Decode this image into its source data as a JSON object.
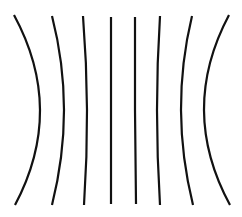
{
  "diagram": {
    "stroke_color": "#111111",
    "background": "#ffffff",
    "lines": [
      {
        "id": "line-1",
        "top": [
          14,
          15
        ],
        "mid": [
          40,
          110
        ],
        "bottom": [
          15,
          205
        ]
      },
      {
        "id": "line-2",
        "top": [
          52,
          16
        ],
        "mid": [
          64,
          110
        ],
        "bottom": [
          52,
          205
        ]
      },
      {
        "id": "line-3",
        "top": [
          83,
          16
        ],
        "mid": [
          87,
          110
        ],
        "bottom": [
          84,
          205
        ]
      },
      {
        "id": "line-4",
        "top": [
          111,
          17
        ],
        "mid": [
          111,
          110
        ],
        "bottom": [
          111,
          204
        ]
      },
      {
        "id": "line-5",
        "top": [
          135,
          17
        ],
        "mid": [
          135,
          110
        ],
        "bottom": [
          136,
          204
        ]
      },
      {
        "id": "line-6",
        "top": [
          160,
          16
        ],
        "mid": [
          157,
          110
        ],
        "bottom": [
          160,
          205
        ]
      },
      {
        "id": "line-7",
        "top": [
          192,
          16
        ],
        "mid": [
          181,
          110
        ],
        "bottom": [
          193,
          205
        ]
      },
      {
        "id": "line-8",
        "top": [
          229,
          15
        ],
        "mid": [
          204,
          110
        ],
        "bottom": [
          230,
          205
        ]
      }
    ]
  }
}
